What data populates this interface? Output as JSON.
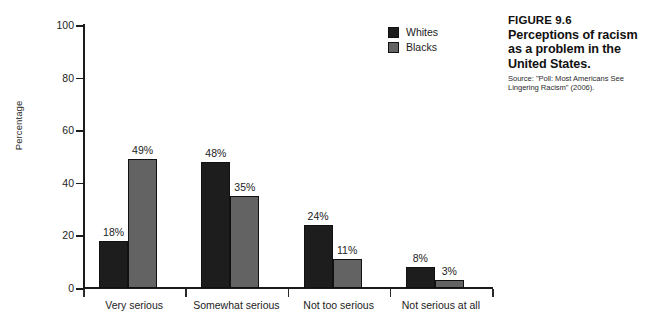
{
  "chart_data": {
    "type": "bar",
    "title": "",
    "xlabel": "",
    "ylabel": "Percentage",
    "ylim": [
      0,
      100
    ],
    "yticks": [
      0,
      20,
      40,
      60,
      80,
      100
    ],
    "grid": false,
    "legend_position": "top-right",
    "categories": [
      "Very serious",
      "Somewhat serious",
      "Not too serious",
      "Not serious at all"
    ],
    "series": [
      {
        "name": "Whites",
        "color": "#1d1d1d",
        "values": [
          18,
          48,
          24,
          8
        ],
        "labels": [
          "18%",
          "48%",
          "24%",
          "8%"
        ]
      },
      {
        "name": "Blacks",
        "color": "#636363",
        "values": [
          49,
          35,
          11,
          3
        ],
        "labels": [
          "49%",
          "35%",
          "11%",
          "3%"
        ]
      }
    ]
  },
  "legend": {
    "items": [
      {
        "label": "Whites",
        "color": "#1d1d1d"
      },
      {
        "label": "Blacks",
        "color": "#636363"
      }
    ]
  },
  "caption": {
    "figure_number": "FIGURE 9.6",
    "title": "Perceptions of racism as a problem in the United States.",
    "source": "Source: \"Poll: Most Americans See Lingering Racism\" (2006)."
  }
}
